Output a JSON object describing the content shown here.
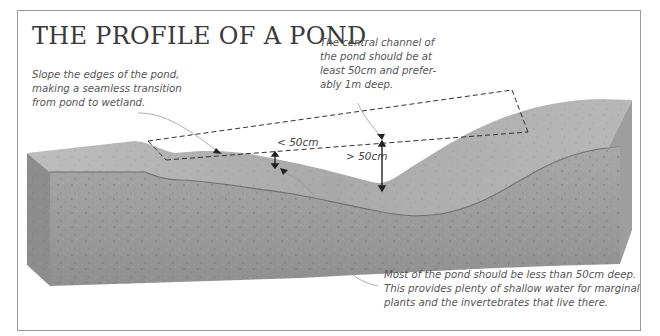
{
  "title": "THE PROFILE OF A POND",
  "annotations": {
    "edges": "Slope the edges of the pond, making a seamless transition from pond to wetland.",
    "channel": "The central channel of the pond should be at least 50cm and prefer-ably 1m deep.",
    "shallow": "Most of the pond should be less than 50cm deep. This provides plenty of shallow water for marginal plants and the invertebrates that live there."
  },
  "depth_labels": {
    "shallow": "< 50cm",
    "deep": "> 50cm"
  },
  "colors": {
    "soil_front": "#9c9c9c",
    "soil_top": "#b4b4b4",
    "soil_side": "#8a8a8a",
    "text": "#555555",
    "frame": "#9a9a9a"
  }
}
